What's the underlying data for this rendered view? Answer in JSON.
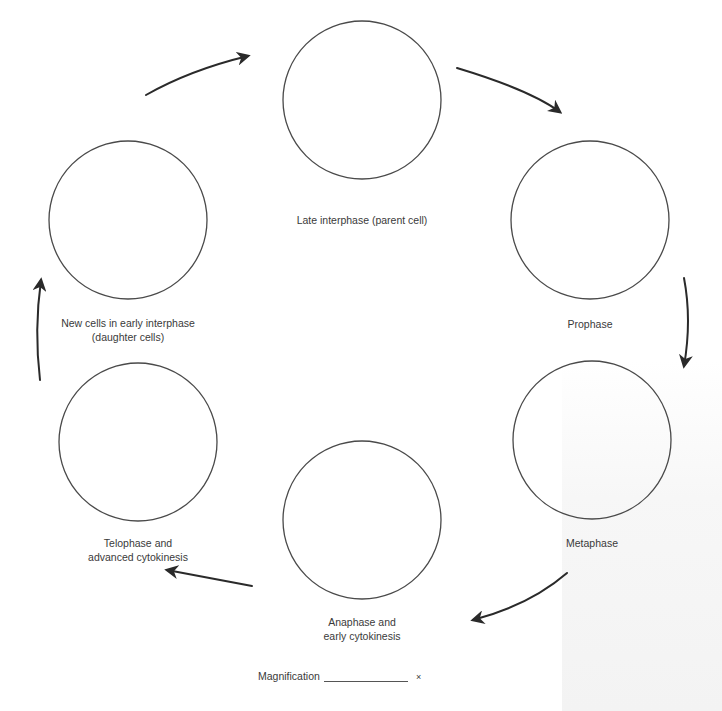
{
  "diagram": {
    "stroke_color": "#4a4a4a",
    "arrow_color": "#2a2a2a",
    "stages": [
      {
        "id": "late-interphase",
        "label_lines": [
          "Late interphase (parent cell)"
        ],
        "cx": 362,
        "cy": 100,
        "r": 79,
        "label_x": 362,
        "label_y": 213
      },
      {
        "id": "prophase",
        "label_lines": [
          "Prophase"
        ],
        "cx": 590,
        "cy": 220,
        "r": 79,
        "label_x": 590,
        "label_y": 317
      },
      {
        "id": "metaphase",
        "label_lines": [
          "Metaphase"
        ],
        "cx": 592,
        "cy": 440,
        "r": 79,
        "label_x": 592,
        "label_y": 536
      },
      {
        "id": "anaphase",
        "label_lines": [
          "Anaphase and",
          "early cytokinesis"
        ],
        "cx": 362,
        "cy": 520,
        "r": 79,
        "label_x": 362,
        "label_y": 615
      },
      {
        "id": "telophase",
        "label_lines": [
          "Telophase and",
          "advanced cytokinesis"
        ],
        "cx": 138,
        "cy": 442,
        "r": 79,
        "label_x": 138,
        "label_y": 536
      },
      {
        "id": "new-cells",
        "label_lines": [
          "New cells in early interphase",
          "(daughter cells)"
        ],
        "cx": 128,
        "cy": 220,
        "r": 79,
        "label_x": 128,
        "label_y": 316
      }
    ],
    "arrows": [
      {
        "id": "arrow-newcells-to-interphase",
        "path": "M146,95 Q190,70 248,56",
        "head": [
          248,
          56
        ]
      },
      {
        "id": "arrow-interphase-to-prophase",
        "path": "M457,68 Q530,90 560,112",
        "head": [
          560,
          112
        ]
      },
      {
        "id": "arrow-prophase-to-metaphase",
        "path": "M684,278 Q692,320 684,366",
        "head": [
          684,
          366
        ]
      },
      {
        "id": "arrow-metaphase-to-anaphase",
        "path": "M567,573 Q530,605 473,620",
        "head": [
          473,
          620
        ]
      },
      {
        "id": "arrow-anaphase-to-telophase",
        "path": "M252,586 Q210,578 167,570",
        "head": [
          167,
          570
        ]
      },
      {
        "id": "arrow-telophase-to-newcells",
        "path": "M40,380 Q34,330 41,280",
        "head": [
          41,
          280
        ]
      }
    ]
  },
  "labels": {
    "late_interphase": "Late interphase (parent cell)",
    "prophase": "Prophase",
    "metaphase": "Metaphase",
    "anaphase_line1": "Anaphase and",
    "anaphase_line2": "early cytokinesis",
    "telophase_line1": "Telophase and",
    "telophase_line2": "advanced cytokinesis",
    "new_cells_line1": "New cells in early interphase",
    "new_cells_line2": "(daughter cells)"
  },
  "magnification": {
    "label": "Magnification",
    "value": "",
    "suffix": "×"
  }
}
